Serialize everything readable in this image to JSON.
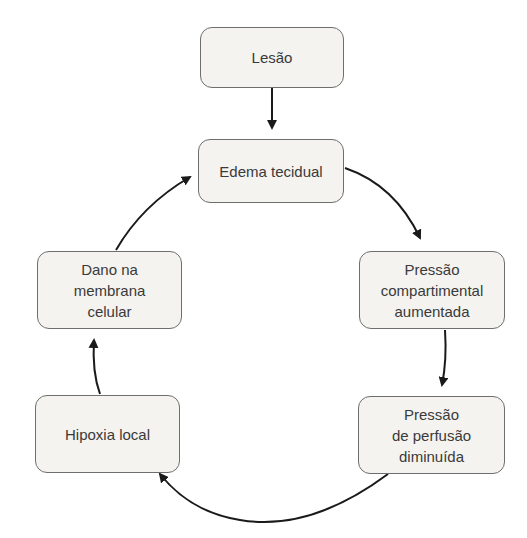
{
  "diagram": {
    "type": "cycle-flowchart",
    "nodes": [
      {
        "id": "lesao",
        "lines": [
          "Lesão"
        ]
      },
      {
        "id": "edema",
        "lines": [
          "Edema tecidual"
        ]
      },
      {
        "id": "pressao-compartimental",
        "lines": [
          "Pressão",
          "compartimental",
          "aumentada"
        ]
      },
      {
        "id": "pressao-perfusao",
        "lines": [
          "Pressão",
          "de perfusão",
          "diminuída"
        ]
      },
      {
        "id": "hipoxia",
        "lines": [
          "Hipoxia local"
        ]
      },
      {
        "id": "dano-membrana",
        "lines": [
          "Dano na",
          "membrana",
          "celular"
        ]
      }
    ],
    "edges": [
      {
        "from": "lesao",
        "to": "edema"
      },
      {
        "from": "edema",
        "to": "pressao-compartimental"
      },
      {
        "from": "pressao-compartimental",
        "to": "pressao-perfusao"
      },
      {
        "from": "pressao-perfusao",
        "to": "hipoxia"
      },
      {
        "from": "hipoxia",
        "to": "dano-membrana"
      },
      {
        "from": "dano-membrana",
        "to": "edema"
      }
    ],
    "colors": {
      "box_fill": "#f4f3f0",
      "box_border": "#6e6e6e",
      "text": "#3a3a3a",
      "arrow": "#1a1a1a"
    }
  }
}
